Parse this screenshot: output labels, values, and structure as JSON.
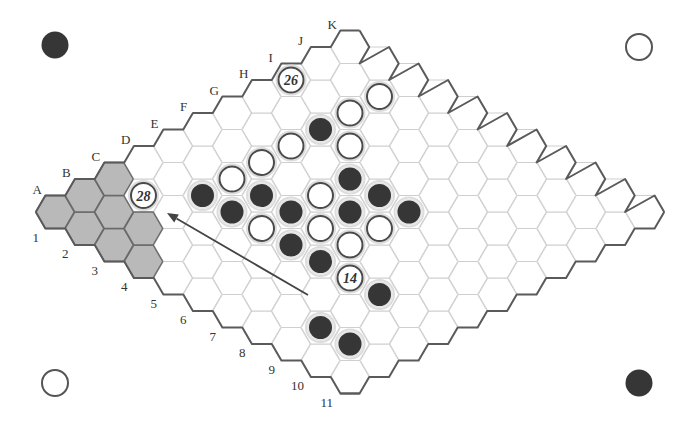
{
  "board": {
    "size": 11,
    "column_labels": [
      "A",
      "B",
      "C",
      "D",
      "E",
      "F",
      "G",
      "H",
      "I",
      "J",
      "K"
    ],
    "row_labels": [
      "1",
      "2",
      "3",
      "4",
      "5",
      "6",
      "7",
      "8",
      "9",
      "10",
      "11"
    ],
    "shaded_cells": [
      "A1",
      "B1",
      "C1",
      "A2",
      "B2",
      "A3",
      "B3",
      "A4"
    ],
    "stones": [
      {
        "cell": "I1",
        "color": "white",
        "label": "26"
      },
      {
        "cell": "J3",
        "color": "white"
      },
      {
        "cell": "I3",
        "color": "white"
      },
      {
        "cell": "H3",
        "color": "black"
      },
      {
        "cell": "H4",
        "color": "white"
      },
      {
        "cell": "G3",
        "color": "white"
      },
      {
        "cell": "F3",
        "color": "white"
      },
      {
        "cell": "E3",
        "color": "white"
      },
      {
        "cell": "D3",
        "color": "black"
      },
      {
        "cell": "E4",
        "color": "black"
      },
      {
        "cell": "G5",
        "color": "black"
      },
      {
        "cell": "F5",
        "color": "white"
      },
      {
        "cell": "G6",
        "color": "black"
      },
      {
        "cell": "D4",
        "color": "black"
      },
      {
        "cell": "E5",
        "color": "black"
      },
      {
        "cell": "F6",
        "color": "black"
      },
      {
        "cell": "G7",
        "color": "black"
      },
      {
        "cell": "D5",
        "color": "white"
      },
      {
        "cell": "E6",
        "color": "white"
      },
      {
        "cell": "F7",
        "color": "white"
      },
      {
        "cell": "D6",
        "color": "black"
      },
      {
        "cell": "E7",
        "color": "white"
      },
      {
        "cell": "D7",
        "color": "black"
      },
      {
        "cell": "D8",
        "color": "white",
        "label": "14"
      },
      {
        "cell": "D9",
        "color": "black"
      },
      {
        "cell": "B9",
        "color": "black"
      },
      {
        "cell": "B10",
        "color": "black"
      },
      {
        "cell": "C2",
        "color": "white",
        "label": "28"
      }
    ],
    "arrow": {
      "from": [
        308,
        295
      ],
      "to": [
        167,
        213
      ]
    }
  },
  "corner_stones": [
    {
      "position": "top-left",
      "color": "black"
    },
    {
      "position": "top-right",
      "color": "white"
    },
    {
      "position": "bottom-left",
      "color": "white"
    },
    {
      "position": "bottom-right",
      "color": "black"
    }
  ],
  "colors": {
    "black_stone": "#363636",
    "white_stone": "#ffffff",
    "shaded_cell": "#b9b9b9",
    "edge": "#5a5a5a",
    "grid": "#cfcfcf"
  }
}
